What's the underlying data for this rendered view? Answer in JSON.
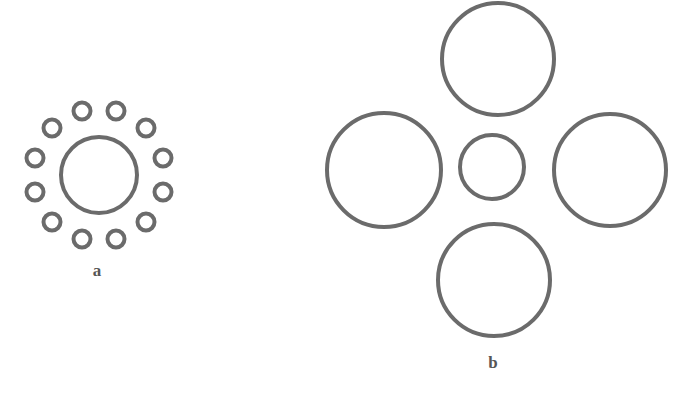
{
  "figure": {
    "name": "Ebbinghaus illusion",
    "background_color": "#ffffff",
    "stroke_color": "#6b6b6b",
    "canvas": {
      "width": 683,
      "height": 393
    }
  },
  "panels": [
    {
      "id": "a",
      "label": "a",
      "label_position": {
        "x": 97,
        "y": 270
      },
      "description": "central circle surrounded by twelve small circles",
      "target_circle": {
        "name": "central-target-circle-a",
        "cx": 99,
        "cy": 175,
        "r": 38,
        "stroke_width": 4
      },
      "inducer_count": 12,
      "inducer_radius": 8.5,
      "inducer_stroke_width": 4,
      "inducer_ring_radius": 66,
      "inducer_angle_offset_deg": 15,
      "inducers": [
        {
          "cx": 116,
          "cy": 111
        },
        {
          "cx": 146,
          "cy": 128
        },
        {
          "cx": 163,
          "cy": 158
        },
        {
          "cx": 163,
          "cy": 192
        },
        {
          "cx": 146,
          "cy": 222
        },
        {
          "cx": 116,
          "cy": 239
        },
        {
          "cx": 82,
          "cy": 239
        },
        {
          "cx": 52,
          "cy": 222
        },
        {
          "cx": 35,
          "cy": 192
        },
        {
          "cx": 35,
          "cy": 158
        },
        {
          "cx": 52,
          "cy": 128
        },
        {
          "cx": 82,
          "cy": 111
        }
      ]
    },
    {
      "id": "b",
      "label": "b",
      "label_position": {
        "x": 493,
        "y": 362
      },
      "description": "central circle surrounded by four large circles",
      "target_circle": {
        "name": "central-target-circle-b",
        "cx": 492,
        "cy": 167,
        "r": 32,
        "stroke_width": 4
      },
      "inducer_count": 4,
      "inducer_stroke_width": 4,
      "inducers": [
        {
          "name": "top-inducer-circle",
          "cx": 498,
          "cy": 59,
          "r": 56
        },
        {
          "name": "left-inducer-circle",
          "cx": 384,
          "cy": 170,
          "r": 57
        },
        {
          "name": "right-inducer-circle",
          "cx": 610,
          "cy": 170,
          "r": 56
        },
        {
          "name": "bottom-inducer-circle",
          "cx": 494,
          "cy": 280,
          "r": 56
        }
      ]
    }
  ]
}
